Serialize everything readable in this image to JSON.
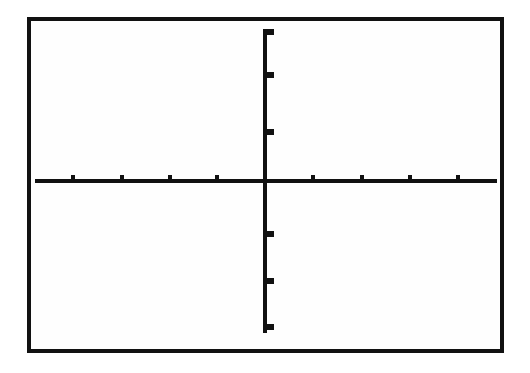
{
  "figure": {
    "background_color": "#ffffff",
    "ink_color": "#111111",
    "width": 530,
    "height": 373
  },
  "frame": {
    "label": "plot-border",
    "x": 27,
    "y": 17,
    "width": 477,
    "height": 336,
    "stroke_width": 4,
    "stroke_color": "#111111",
    "fill_color": "#fefefe"
  },
  "axes": {
    "x_axis": {
      "label": "x-axis",
      "y": 181,
      "x_start": 35,
      "x_end": 497,
      "stroke_width": 4,
      "stroke_color": "#111111"
    },
    "y_axis": {
      "label": "y-axis",
      "x": 265,
      "y_start": 29,
      "y_end": 333,
      "stroke_width": 4,
      "stroke_color": "#111111"
    },
    "origin": {
      "x": 265,
      "y": 181
    }
  },
  "ticks": {
    "x_tick_width": 4,
    "x_tick_height": 5,
    "x_tick_direction": "up",
    "x_positions": [
      73,
      122,
      170,
      217,
      313,
      362,
      410,
      458
    ],
    "y_tick_width": 7,
    "y_tick_height": 5,
    "y_tick_direction": "right",
    "y_positions": [
      31,
      74,
      131,
      233,
      280,
      326
    ],
    "x_spacing": 48,
    "y_spacing": 48
  },
  "chart_data": {
    "type": "line",
    "title": "",
    "subtitle": "",
    "xlabel": "",
    "ylabel": "",
    "series": [],
    "categories": [],
    "values": [],
    "annotations": [],
    "legend": [],
    "legend_position": "none",
    "grid": false,
    "xlim": [
      -4.8,
      4.8
    ],
    "ylim": [
      -3.2,
      3.2
    ],
    "x_tick_values": [
      -4,
      -3,
      -2,
      -1,
      1,
      2,
      3,
      4
    ],
    "y_tick_values": [
      3,
      2,
      1,
      -1,
      -2,
      -3
    ],
    "tick_labels_shown": false
  }
}
